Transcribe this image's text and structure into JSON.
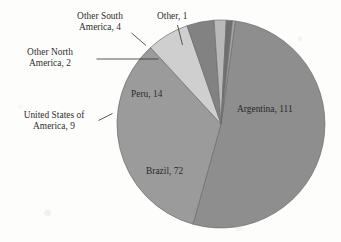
{
  "chart_data": {
    "type": "pie",
    "title": "",
    "subtitle": "",
    "xlabel": "",
    "ylabel": "",
    "legend_position": "none",
    "grid": false,
    "total": 213,
    "categories": [
      "Argentina",
      "Brazil",
      "Peru",
      "United States of America",
      "Other South America",
      "Other North America",
      "Other"
    ],
    "values": [
      111,
      72,
      14,
      9,
      4,
      2,
      1
    ],
    "slices": [
      {
        "name": "Argentina",
        "label": "Argentina, 111",
        "value": 111,
        "color": "#8e8e8e",
        "label_placement": "inside"
      },
      {
        "name": "Brazil",
        "label": "Brazil, 72",
        "value": 72,
        "color": "#9b9b9b",
        "label_placement": "inside"
      },
      {
        "name": "Peru",
        "label": "Peru, 14",
        "value": 14,
        "color": "#cfcfcf",
        "label_placement": "inside"
      },
      {
        "name": "United States of America",
        "label": "United States of America, 9",
        "label_line1": "United States of",
        "label_line2": "America, 9",
        "value": 9,
        "color": "#828282",
        "label_placement": "outside-left"
      },
      {
        "name": "Other South America",
        "label": "Other South America, 4",
        "label_line1": "Other South",
        "label_line2": "America, 4",
        "value": 4,
        "color": "#b9b9b9",
        "label_placement": "outside-top"
      },
      {
        "name": "Other North America",
        "label": "Other North America, 2",
        "label_line1": "Other North",
        "label_line2": "America, 2",
        "value": 2,
        "color": "#6f6f6f",
        "label_placement": "outside-left"
      },
      {
        "name": "Other",
        "label": "Other, 1",
        "value": 1,
        "color": "#a3a3a3",
        "label_placement": "outside-top"
      }
    ],
    "colors": {
      "background": "#fdfdfc",
      "outline": "#6d6d6d",
      "leader_line": "#3a3a3a",
      "text": "#2e2e2e"
    }
  }
}
